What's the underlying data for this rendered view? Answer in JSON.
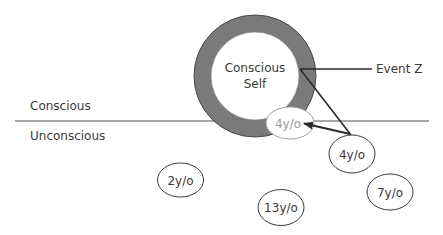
{
  "diagram": {
    "colors": {
      "ring": "#7a7a7a",
      "ring_outline": "#4a4a4a",
      "divider": "#a8a8a8",
      "text": "#3a3a3a",
      "faded_text": "#9a9a9a",
      "arrow": "#2a2a2a"
    },
    "regions": {
      "conscious_label": "Conscious",
      "unconscious_label": "Unconscious"
    },
    "self": {
      "line1": "Conscious",
      "line2": "Self"
    },
    "event": {
      "label": "Event Z"
    },
    "memories": [
      {
        "id": "memory-4yo-surfaced",
        "label": "4y/o",
        "faded": true
      },
      {
        "id": "memory-4yo",
        "label": "4y/o",
        "faded": false
      },
      {
        "id": "memory-2yo",
        "label": "2y/o",
        "faded": false
      },
      {
        "id": "memory-13yo",
        "label": "13y/o",
        "faded": false
      },
      {
        "id": "memory-7yo",
        "label": "7y/o",
        "faded": false
      }
    ]
  }
}
